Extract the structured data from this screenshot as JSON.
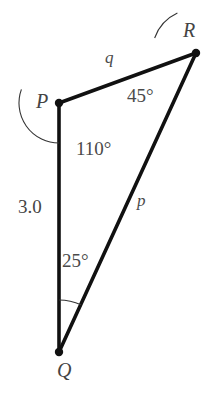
{
  "figure": {
    "type": "geometry-diagram",
    "shape": "triangle",
    "caption_fragment": "g. 4",
    "background_color": "#ffffff",
    "stroke_color": "#111111",
    "text_color": "#444444",
    "arc_color": "#333333",
    "stroke_width": 3.6,
    "arc_width": 1.1,
    "vertex_dot_radius": 4.2
  },
  "vertices": [
    {
      "id": "P",
      "label": "P",
      "x": 59,
      "y": 103,
      "label_x": 36,
      "label_y": 91
    },
    {
      "id": "R",
      "label": "R",
      "x": 196,
      "y": 53,
      "label_x": 183,
      "label_y": 20
    },
    {
      "id": "Q",
      "label": "Q",
      "x": 59,
      "y": 352,
      "label_x": 57,
      "label_y": 360
    }
  ],
  "sides": [
    {
      "id": "PR",
      "label": "q",
      "from": "P",
      "to": "R",
      "label_x": 105,
      "label_y": 49,
      "kind": "variable"
    },
    {
      "id": "QR",
      "label": "p",
      "from": "Q",
      "to": "R",
      "label_x": 137,
      "label_y": 192,
      "kind": "variable"
    },
    {
      "id": "PQ",
      "label": "3.0",
      "from": "P",
      "to": "Q",
      "label_x": 18,
      "label_y": 197,
      "kind": "measure"
    }
  ],
  "angles": [
    {
      "at": "P",
      "label": "110°",
      "value": 110,
      "label_x": 76,
      "label_y": 139,
      "arc_radius": 40,
      "start_deg": 90,
      "end_deg": 200
    },
    {
      "at": "R",
      "label": "45°",
      "value": 45,
      "label_x": 127,
      "label_y": 86,
      "arc_radius": 44,
      "start_deg": 200,
      "end_deg": 245
    },
    {
      "at": "Q",
      "label": "25°",
      "value": 25,
      "label_x": 62,
      "label_y": 251,
      "arc_radius": 52,
      "start_deg": 270,
      "end_deg": 295
    }
  ],
  "chart_data": {
    "type": "diagram",
    "vertices": [
      "P",
      "Q",
      "R"
    ],
    "side_labels": {
      "PR": "q",
      "QR": "p",
      "PQ": "3.0"
    },
    "angle_labels": {
      "P": "110°",
      "R": "45°",
      "Q": "25°"
    },
    "angle_values_deg": {
      "P": 110,
      "R": 45,
      "Q": 25
    },
    "known_length": {
      "side": "PQ",
      "value": 3.0
    }
  }
}
